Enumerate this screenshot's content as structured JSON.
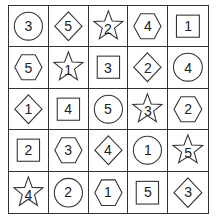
{
  "puzzle": {
    "rows": 5,
    "cols": 5,
    "cells": [
      [
        {
          "shape": "circle",
          "value": "3"
        },
        {
          "shape": "diamond",
          "value": "5"
        },
        {
          "shape": "star",
          "value": "2"
        },
        {
          "shape": "hexagon",
          "value": "4"
        },
        {
          "shape": "square",
          "value": "1"
        }
      ],
      [
        {
          "shape": "hexagon",
          "value": "5"
        },
        {
          "shape": "star",
          "value": "1"
        },
        {
          "shape": "square",
          "value": "3"
        },
        {
          "shape": "diamond",
          "value": "2"
        },
        {
          "shape": "circle",
          "value": "4"
        }
      ],
      [
        {
          "shape": "diamond",
          "value": "1"
        },
        {
          "shape": "square",
          "value": "4"
        },
        {
          "shape": "circle",
          "value": "5"
        },
        {
          "shape": "star",
          "value": "3"
        },
        {
          "shape": "hexagon",
          "value": "2"
        }
      ],
      [
        {
          "shape": "square",
          "value": "2"
        },
        {
          "shape": "hexagon",
          "value": "3"
        },
        {
          "shape": "diamond",
          "value": "4"
        },
        {
          "shape": "circle",
          "value": "1"
        },
        {
          "shape": "star",
          "value": "5"
        }
      ],
      [
        {
          "shape": "star",
          "value": "4"
        },
        {
          "shape": "circle",
          "value": "2"
        },
        {
          "shape": "hexagon",
          "value": "1"
        },
        {
          "shape": "square",
          "value": "5"
        },
        {
          "shape": "diamond",
          "value": "3"
        }
      ]
    ]
  },
  "colors": {
    "stroke": "#333333",
    "background": "#ffffff",
    "text": "#222222"
  }
}
